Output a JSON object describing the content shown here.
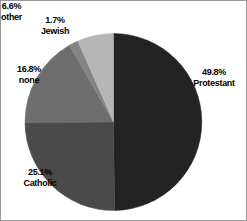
{
  "chart_data": {
    "type": "pie",
    "title": "",
    "subtitle": "",
    "xlabel": "",
    "ylabel": "",
    "grid": false,
    "legend_position": "none",
    "label_format": "percent-above-name",
    "start_angle_deg": 0,
    "direction": "clockwise",
    "categories": [
      "Protestant",
      "Catholic",
      "none",
      "Jewish",
      "other"
    ],
    "values": [
      49.8,
      25.1,
      16.8,
      1.7,
      6.6
    ],
    "units": "%",
    "slices": [
      {
        "name": "Protestant",
        "percent_label": "49.8%",
        "value": 49.8,
        "color": "#232323"
      },
      {
        "name": "Catholic",
        "percent_label": "25.1%",
        "value": 25.1,
        "color": "#4a4a4a"
      },
      {
        "name": "none",
        "percent_label": "16.8%",
        "value": 16.8,
        "color": "#6e6e6e"
      },
      {
        "name": "Jewish",
        "percent_label": "1.7%",
        "value": 1.7,
        "color": "#848484"
      },
      {
        "name": "other",
        "percent_label": "6.6%",
        "value": 6.6,
        "color": "#b6b6b6"
      }
    ]
  },
  "labels": {
    "protestant": {
      "pct": "49.8%",
      "name": "Protestant"
    },
    "catholic": {
      "pct": "25.1%",
      "name": "Catholic"
    },
    "none": {
      "pct": "16.8%",
      "name": "none"
    },
    "jewish": {
      "pct": "1.7%",
      "name": "Jewish"
    },
    "other": {
      "pct": "6.6%",
      "name": "other"
    }
  },
  "colors": {
    "background": "#ffffff",
    "text": "#000000",
    "border": "#9a9a9a",
    "protestant": "#232323",
    "catholic": "#4a4a4a",
    "none": "#6e6e6e",
    "jewish": "#848484",
    "other": "#b6b6b6"
  }
}
